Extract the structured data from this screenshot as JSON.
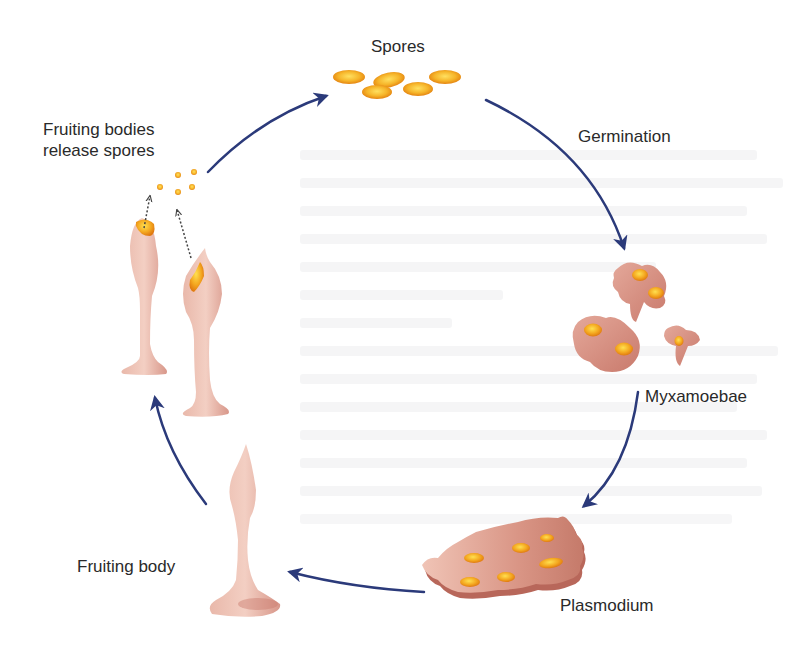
{
  "diagram": {
    "type": "life-cycle",
    "colors": {
      "arrow": "#2b3a7a",
      "cell_body": "#d99a8c",
      "cell_shadow": "#b8675a",
      "nucleus": "#f0a020",
      "nucleus_highlight": "#ffd040",
      "label_text": "#2a2a2a"
    },
    "stages": [
      {
        "id": "spores",
        "label": "Spores"
      },
      {
        "id": "germination",
        "label": "Germination"
      },
      {
        "id": "myxamoebae",
        "label": "Myxamoebae"
      },
      {
        "id": "plasmodium",
        "label": "Plasmodium"
      },
      {
        "id": "fruiting-body",
        "label": "Fruiting body"
      },
      {
        "id": "fruiting-bodies-release",
        "label_line1": "Fruiting bodies",
        "label_line2": "release spores"
      }
    ],
    "arrows": [
      {
        "from": "fruiting-bodies-release",
        "to": "spores"
      },
      {
        "from": "spores",
        "to": "myxamoebae",
        "via": "germination"
      },
      {
        "from": "myxamoebae",
        "to": "plasmodium"
      },
      {
        "from": "plasmodium",
        "to": "fruiting-body"
      },
      {
        "from": "fruiting-body",
        "to": "fruiting-bodies-release"
      }
    ]
  }
}
